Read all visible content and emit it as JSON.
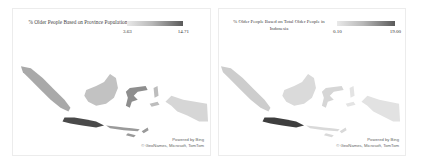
{
  "panels": [
    {
      "title": "% Older People Based on Province Population",
      "legend": {
        "min": "3.63",
        "max": "14.71",
        "color_low": "#e9e9e9",
        "color_high": "#5a5a5a"
      },
      "attribution": {
        "line1": "Powered by Bing",
        "line2": "© GeoNames, Microsoft, TomTom"
      },
      "regions": {
        "sumatra": "#a9a9a9",
        "kalimantan": "#c2c2c2",
        "sulawesi": "#8e8e8e",
        "java": "#4a4a4a",
        "nusa_tenggara": "#9a9a9a",
        "maluku": "#bdbdbd",
        "papua": "#d6d6d6"
      }
    },
    {
      "title": "% Older People Based on Total Older People in Indonesia",
      "legend": {
        "min": "0.10",
        "max": "19.00",
        "color_low": "#e9e9e9",
        "color_high": "#5a5a5a"
      },
      "attribution": {
        "line1": "Powered by Bing",
        "line2": "© GeoNames, Microsoft, TomTom"
      },
      "regions": {
        "sumatra": "#cdcdcd",
        "kalimantan": "#dadada",
        "sulawesi": "#d6d6d6",
        "java": "#3e3e3e",
        "nusa_tenggara": "#d9d9d9",
        "maluku": "#e4e4e4",
        "papua": "#e2e2e2"
      }
    }
  ]
}
